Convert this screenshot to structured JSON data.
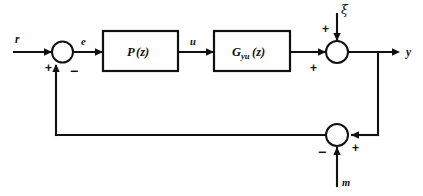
{
  "diagram": {
    "type": "control-system-block-diagram",
    "title": "",
    "background_color": "#ffffff",
    "line_color": "#111111",
    "signals": {
      "reference": "r",
      "error": "e",
      "control": "u",
      "output": "y",
      "disturbance": "ξ",
      "measurement_noise": "m"
    },
    "blocks": [
      {
        "id": "controller",
        "label_main": "P",
        "label_arg": "(z)",
        "subscript": ""
      },
      {
        "id": "plant",
        "label_main": "G",
        "label_arg": "(z)",
        "subscript": "yu"
      }
    ],
    "summing_junctions": [
      {
        "id": "error-junction",
        "signs": {
          "input_left": "+",
          "input_bottom": "−"
        }
      },
      {
        "id": "output-junction",
        "signs": {
          "input_left": "+",
          "input_top": "+"
        }
      },
      {
        "id": "feedback-junction",
        "signs": {
          "input_right": "+",
          "input_bottom": "−"
        }
      }
    ]
  }
}
